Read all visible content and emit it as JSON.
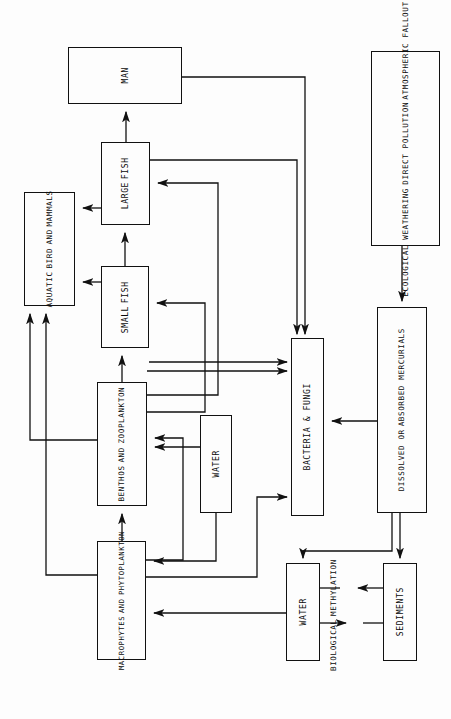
{
  "diagram": {
    "orientation": "rotated-90",
    "line_color": "#111111",
    "background": "#ffffff",
    "nodes": [
      {
        "id": "man",
        "label_lines": [
          "MAN"
        ],
        "x": 68,
        "y": 47,
        "w": 114,
        "h": 57
      },
      {
        "id": "large-fish",
        "label_lines": [
          "LARGE",
          "FISH"
        ],
        "x": 101,
        "y": 142,
        "w": 49,
        "h": 83
      },
      {
        "id": "small-fish",
        "label_lines": [
          "SMALL",
          "FISH"
        ],
        "x": 101,
        "y": 266,
        "w": 48,
        "h": 82
      },
      {
        "id": "aquatic-bird-and-mammals",
        "label_lines": [
          "AQUATIC",
          "BIRD",
          "AND",
          "MAMMALS"
        ],
        "x": 24,
        "y": 192,
        "w": 51,
        "h": 114
      },
      {
        "id": "benthos-and-zooplankton",
        "label_lines": [
          "BENTHOS",
          "AND",
          "ZOOPLANKTON"
        ],
        "x": 97,
        "y": 382,
        "w": 50,
        "h": 124
      },
      {
        "id": "macrophytes-and-phytoplankton",
        "label_lines": [
          "MACROPHYTES",
          "AND",
          "PHYTOPLANKTON"
        ],
        "x": 97,
        "y": 541,
        "w": 49,
        "h": 119
      },
      {
        "id": "water-mid",
        "label_lines": [
          "WATER"
        ],
        "x": 200,
        "y": 415,
        "w": 32,
        "h": 98
      },
      {
        "id": "bacteria-and-fungi",
        "label_lines": [
          "BACTERIA & FUNGI"
        ],
        "x": 291,
        "y": 338,
        "w": 33,
        "h": 178
      },
      {
        "id": "ecological-weathering",
        "label_lines": [
          "ECOLOGICAL WEATHERING",
          "DIRECT POLLUTION",
          "ATMOSPHERIC FALLOUT"
        ],
        "x": 371,
        "y": 51,
        "w": 69,
        "h": 195
      },
      {
        "id": "dissolved-or-absorbed-mercurials",
        "label_lines": [
          "DISSOLVED OR",
          "ABSORBED MERCURIALS"
        ],
        "x": 377,
        "y": 307,
        "w": 50,
        "h": 206
      },
      {
        "id": "water-bottom",
        "label_lines": [
          "WATER"
        ],
        "x": 286,
        "y": 563,
        "w": 34,
        "h": 98
      },
      {
        "id": "sediments",
        "label_lines": [
          "SEDIMENTS"
        ],
        "x": 383,
        "y": 563,
        "w": 34,
        "h": 98
      }
    ],
    "free_labels": [
      {
        "id": "biological-methylation",
        "lines": [
          "BIOLOGICAL",
          "METHYLATION"
        ],
        "x": 330,
        "y": 570,
        "w": 34,
        "h": 90
      }
    ],
    "edges": [
      {
        "from": "large-fish",
        "to": "man",
        "path": "M 126,142 L 126,110",
        "arrow": "up"
      },
      {
        "from": "small-fish",
        "to": "large-fish",
        "path": "M 125,266 L 125,231",
        "arrow": "up"
      },
      {
        "from": "benthos",
        "to": "small-fish",
        "path": "M 122,382 L 122,354",
        "arrow": "up"
      },
      {
        "from": "macrophytes",
        "to": "benthos",
        "path": "M 122,541 L 122,512",
        "arrow": "up"
      },
      {
        "from": "large-fish",
        "to": "aquatic-bird",
        "path": "M 101,208 L 81,208",
        "arrow": "left"
      },
      {
        "from": "small-fish",
        "to": "aquatic-bird",
        "path": "M 101,282 L 81,282",
        "arrow": "left"
      },
      {
        "from": "benthos",
        "to": "aquatic-bird",
        "path": "M 97,440 L 30,440 L 30,312",
        "arrow": "up"
      },
      {
        "from": "macrophytes",
        "to": "aquatic-bird",
        "path": "M 97,575 L 46,575 L 46,312",
        "arrow": "up"
      },
      {
        "from": "benthos",
        "to": "large-fish",
        "path": "M 147,395 L 218,395 L 218,183 L 156,183",
        "arrow": "left"
      },
      {
        "from": "benthos",
        "to": "small-fish",
        "path": "M 147,410 L 205,410 L 205,303 L 155,303",
        "arrow": "left"
      },
      {
        "from": "macrophytes",
        "to": "benthos",
        "path": "M 146,560 L 183,560 L 183,438 L 153,438",
        "arrow": "left"
      },
      {
        "from": "water-mid",
        "to": "benthos",
        "path": "M 200,447 L 153,447",
        "arrow": "left"
      },
      {
        "from": "water-mid",
        "to": "macrophytes",
        "path": "M 216,513 L 216,561 L 152,561",
        "arrow": "left"
      },
      {
        "from": "man",
        "to": "bacteria",
        "path": "M 182,77 L 305,77 L 305,332",
        "arrow": "down"
      },
      {
        "from": "large-fish",
        "to": "bacteria",
        "path": "M 150,160 L 297,160 L 297,332",
        "arrow": "down"
      },
      {
        "from": "small-fish",
        "to": "bacteria",
        "path": "M 149,362 L 285,362",
        "arrow": "right"
      },
      {
        "from": "benthos",
        "to": "bacteria",
        "path": "M 147,371 L 285,371",
        "arrow": "right"
      },
      {
        "from": "macrophytes",
        "to": "bacteria",
        "path": "M 146,577 L 257,577 L 257,497 L 285,497",
        "arrow": "right"
      },
      {
        "from": "mercurials",
        "to": "bacteria",
        "path": "M 377,421 L 330,421",
        "arrow": "left"
      },
      {
        "from": "ecological-weathering",
        "to": "mercurials",
        "path": "M 402,246 L 402,300",
        "arrow": "down"
      },
      {
        "from": "mercurials",
        "to": "water-bottom",
        "path": "M 392,513 L 392,551 L 303,551 L 303,557",
        "arrow": "down"
      },
      {
        "from": "mercurials",
        "to": "sediments",
        "path": "M 400,513 L 400,557",
        "arrow": "down"
      },
      {
        "from": "water-bottom",
        "to": "methylation",
        "path": "M 320,623 L 345,623",
        "arrow": "right"
      },
      {
        "from": "sediments",
        "to": "methylation",
        "path": "M 383,588 L 357,588",
        "arrow": "left"
      },
      {
        "from": "water-bottom",
        "to": "macrophytes",
        "path": "M 286,613 L 152,613",
        "arrow": "left"
      },
      {
        "from": "water-bottom",
        "to": "methylation-plain",
        "path": "M 320,588 L 357,588",
        "arrow": "none"
      },
      {
        "from": "sediments",
        "to": "methylation-plain2",
        "path": "M 383,623 L 345,623",
        "arrow": "none"
      }
    ]
  }
}
